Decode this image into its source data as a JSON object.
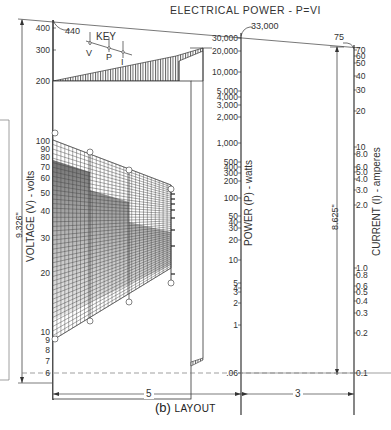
{
  "title": "ELECTRICAL POWER - P=VI",
  "caption": {
    "prefix": "(b)",
    "text": "LAYOUT"
  },
  "key": {
    "label": "KEY",
    "v": "V",
    "p": "P",
    "i": "I"
  },
  "voltage_scale": {
    "label": "VOLTAGE (V) - volts",
    "length": "9.326\"",
    "top_value": "440",
    "ticks": [
      "400",
      "300",
      "200",
      "100",
      "90",
      "80",
      "70",
      "60",
      "50",
      "40",
      "30",
      "20",
      "10",
      "9",
      "8",
      "7",
      "6"
    ]
  },
  "power_scale": {
    "label": "POWER (P) - watts",
    "top_value": "33,000",
    "ticks": [
      "30,000",
      "20,000",
      "10,000",
      "5,000",
      "4,000",
      "3,000",
      "2,000",
      "1,000",
      "500",
      "400",
      "300",
      "200",
      "100",
      "50",
      "40",
      "30",
      "20",
      "10",
      "5",
      "4",
      "3",
      "2",
      "1",
      ".06"
    ]
  },
  "current_scale": {
    "label": "CURRENT (I) - amperes",
    "length": "8.625\"",
    "top_value": "75",
    "ticks": [
      "70",
      "60",
      "50",
      "40",
      "30",
      "20",
      "10",
      "8.0",
      "6.0",
      "5.0",
      "4.0",
      "3.0",
      "2.0",
      "1.0",
      "0.8",
      "0.6",
      "0.5",
      "0.4",
      "0.3",
      "0.2",
      "0.1"
    ]
  },
  "dimensions": {
    "left_width": "5",
    "right_width": "3"
  },
  "colors": {
    "ink": "#333333",
    "grid": "#555555",
    "hatch": "#666666",
    "background": "#ffffff"
  }
}
